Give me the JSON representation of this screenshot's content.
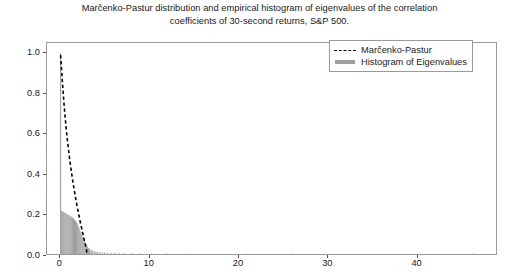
{
  "chart_data": {
    "type": "bar",
    "title": "Marčenko-Pastur distribution and empirical histogram of eigenvalues of the correlation coefficients of 30-second returns, S&P 500.",
    "title_lines": [
      "Marčenko-Pastur distribution and empirical histogram of eigenvalues of the correlation",
      "coefficients of 30-second returns, S&P 500."
    ],
    "xlabel": "",
    "ylabel": "",
    "xlim": [
      -1.5,
      49.0
    ],
    "ylim": [
      0.0,
      1.05
    ],
    "grid": false,
    "legend_position": "upper right",
    "xticks": [
      0,
      10,
      20,
      30,
      40
    ],
    "xtick_labels": [
      "0",
      "10",
      "20",
      "30",
      "40"
    ],
    "yticks": [
      0.0,
      0.2,
      0.4,
      0.6,
      0.8,
      1.0
    ],
    "ytick_labels": [
      "0.0",
      "0.2",
      "0.4",
      "0.6",
      "0.8",
      "1.0"
    ],
    "series": [
      {
        "name": "Marčenko-Pastur",
        "type": "line",
        "style": "dashed",
        "color": "#000000",
        "x": [
          0.02,
          0.05,
          0.08,
          0.12,
          0.18,
          0.25,
          0.35,
          0.5,
          0.7,
          0.9,
          1.1,
          1.3,
          1.5,
          1.7,
          1.9,
          2.1,
          2.3,
          2.5,
          2.7,
          2.85,
          2.95,
          3.0
        ],
        "y": [
          0.99,
          0.975,
          0.955,
          0.93,
          0.89,
          0.845,
          0.785,
          0.7,
          0.605,
          0.525,
          0.455,
          0.392,
          0.335,
          0.283,
          0.235,
          0.19,
          0.148,
          0.108,
          0.068,
          0.04,
          0.018,
          0.0
        ]
      },
      {
        "name": "Histogram of Eigenvalues",
        "type": "bar",
        "color": "#9e9e9e",
        "bin_width": 0.12,
        "x": [
          0.03,
          0.15,
          0.27,
          0.39,
          0.51,
          0.63,
          0.75,
          0.87,
          0.99,
          1.11,
          1.23,
          1.35,
          1.47,
          1.59,
          1.71,
          1.83,
          1.95,
          2.07,
          2.19,
          2.31,
          2.43,
          2.55,
          2.67,
          2.79,
          2.91,
          3.03,
          3.15,
          3.3,
          3.45,
          3.6,
          3.8,
          4.0,
          4.2,
          4.45,
          4.7,
          5.0,
          5.3,
          5.7,
          6.1,
          6.6,
          7.2,
          8.0,
          9.0,
          10.3,
          12.0,
          14.5,
          17.5,
          21.0,
          26.0,
          33.0,
          46.5
        ],
        "y": [
          1.0,
          0.215,
          0.212,
          0.208,
          0.205,
          0.202,
          0.198,
          0.195,
          0.192,
          0.19,
          0.186,
          0.182,
          0.178,
          0.172,
          0.166,
          0.158,
          0.148,
          0.136,
          0.122,
          0.108,
          0.094,
          0.082,
          0.07,
          0.058,
          0.048,
          0.038,
          0.031,
          0.026,
          0.021,
          0.017,
          0.014,
          0.012,
          0.01,
          0.009,
          0.008,
          0.0075,
          0.007,
          0.006,
          0.0055,
          0.005,
          0.0045,
          0.004,
          0.0035,
          0.003,
          0.0028,
          0.0025,
          0.0022,
          0.002,
          0.0018,
          0.0015,
          0.0025
        ]
      }
    ],
    "legend_entries": [
      {
        "label": "Marčenko-Pastur",
        "style": "dashed",
        "color": "#000000"
      },
      {
        "label": "Histogram of Eigenvalues",
        "style": "bar",
        "color": "#9e9e9e"
      }
    ]
  }
}
